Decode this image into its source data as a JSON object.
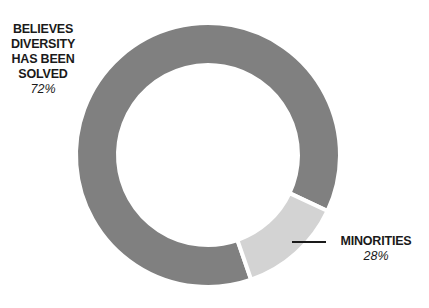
{
  "chart_data": {
    "type": "pie",
    "variant": "donut",
    "title": "",
    "slices": [
      {
        "label": "BELIEVES\nDIVERSITY\nHAS BEEN\nSOLVED",
        "value": 72,
        "display": "72%",
        "color": "#808080"
      },
      {
        "label": "MINORITIES",
        "value": 28,
        "display": "28%",
        "color": "#d3d3d3"
      }
    ],
    "legend": "none",
    "annotations": [
      {
        "target": "MINORITIES",
        "type": "leader-line"
      }
    ]
  }
}
